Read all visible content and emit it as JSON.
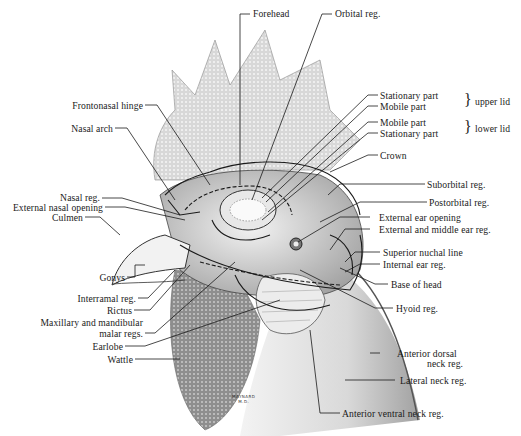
{
  "figure": {
    "signature": [
      "MAYNARD",
      "M.D."
    ]
  },
  "labels_top": {
    "forehead": "Forehead",
    "orbital": "Orbital reg."
  },
  "labels_right": {
    "upper_stationary": "Stationary part",
    "upper_mobile": "Mobile part",
    "upper_group": "upper lid",
    "lower_mobile": "Mobile part",
    "lower_stationary": "Stationary part",
    "lower_group": "lower lid",
    "crown": "Crown",
    "suborbital": "Suborbital reg.",
    "postorbital": "Postorbital reg.",
    "external_ear_opening": "External ear opening",
    "external_middle_ear": "External and middle ear reg.",
    "superior_nuchal_line": "Superior nuchal line",
    "internal_ear": "Internal ear reg.",
    "base_of_head": "Base of head",
    "hyoid": "Hyoid reg.",
    "anterior_dorsal_1": "Anterior dorsal",
    "anterior_dorsal_2": "neck reg.",
    "lateral_neck": "Lateral neck reg.",
    "anterior_ventral_neck": "Anterior ventral neck reg."
  },
  "labels_left": {
    "frontonasal_hinge": "Frontonasal hinge",
    "nasal_arch": "Nasal arch",
    "nasal_reg": "Nasal reg.",
    "external_nasal_opening": "External nasal opening",
    "culmen": "Culmen",
    "gonys": "Gonys",
    "interramal": "Interramal reg.",
    "rictus": "Rictus",
    "malar_1": "Maxillary and mandibular",
    "malar_2": "malar regs.",
    "earlobe": "Earlobe",
    "wattle": "Wattle"
  },
  "colors": {
    "ink": "#1a1a1a",
    "comb_shade": "#cfcfcf",
    "wattle_shade": "#9a9a9a",
    "neck_shade": "#e2e2e2"
  }
}
